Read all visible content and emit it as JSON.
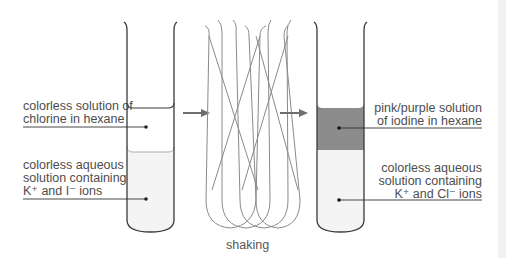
{
  "diagram": {
    "type": "chemistry-process",
    "steps": [
      "initial",
      "shaking",
      "final"
    ]
  },
  "left_tube": {
    "top_label": {
      "lines": [
        "colorless solution of",
        "chlorine in hexane"
      ]
    },
    "bottom_label": {
      "lines": [
        "colorless aqueous",
        "solution containing",
        "K⁺ and I⁻ ions"
      ]
    },
    "upper_layer_color": "#ffffff",
    "lower_layer_color": "#f4f4f4"
  },
  "middle": {
    "caption": "shaking"
  },
  "right_tube": {
    "top_label": {
      "lines": [
        "pink/purple solution",
        "of iodine in hexane"
      ]
    },
    "bottom_label": {
      "lines": [
        "colorless aqueous",
        "solution containing",
        "K⁺ and Cl⁻ ions"
      ]
    },
    "upper_layer_color": "#8c8c8c",
    "lower_layer_color": "#f4f4f4"
  },
  "colors": {
    "outline": "#3a3a3a",
    "arrow": "#6e6e6e",
    "shaking_lines": "#8a8a8a",
    "leader_line": "#333333"
  }
}
